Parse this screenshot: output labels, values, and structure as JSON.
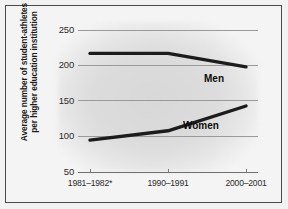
{
  "chart_data": {
    "type": "line",
    "title": "",
    "subtitle": "",
    "xlabel": "",
    "ylabel": "Average number of student-athletes per higher education institution",
    "categories": [
      "1981–1982*",
      "1990–1991",
      "2000–2001"
    ],
    "series": [
      {
        "name": "Men",
        "values": [
          217,
          217,
          198
        ],
        "color": "#1c1c1c"
      },
      {
        "name": "Women",
        "values": [
          95,
          108,
          143
        ],
        "color": "#1c1c1c"
      }
    ],
    "ylim": [
      50,
      250
    ],
    "yticks": [
      "250",
      "200",
      "150",
      "100",
      "50"
    ],
    "ytick_values": [
      250,
      200,
      150,
      100,
      50
    ],
    "grid": true,
    "legend_position": "inline-annotations",
    "annotations": [
      {
        "text": "Men",
        "series": "Men"
      },
      {
        "text": "Women",
        "series": "Women"
      }
    ],
    "footnote_marker": "*"
  },
  "axis": {
    "y_label_line1": "Average number of student-athletes",
    "y_label_line2": "per higher education institution"
  },
  "colors": {
    "background": "#f2f2f2",
    "panel": "#f4f4f4",
    "frame": "#4a4a4a",
    "grid": "#9a9a9a",
    "line": "#1c1c1c",
    "text": "#1a1a1a"
  }
}
